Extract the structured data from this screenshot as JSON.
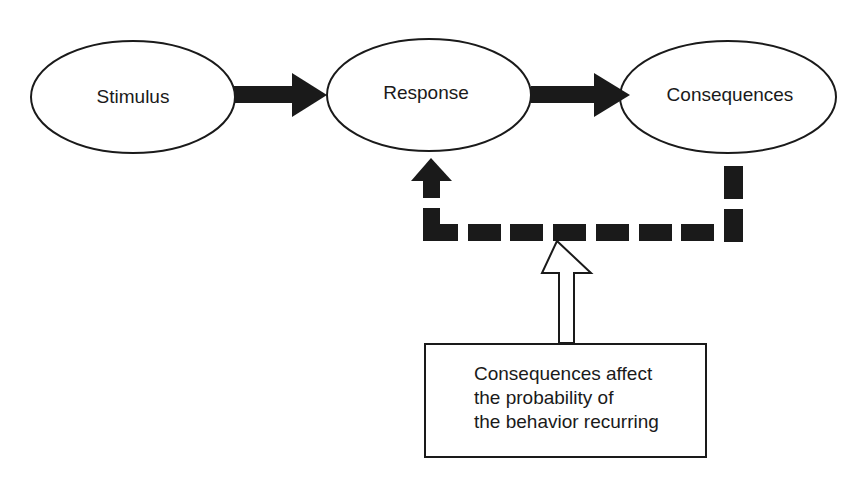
{
  "diagram": {
    "type": "flow",
    "nodes": [
      {
        "id": "stimulus",
        "label": "Stimulus",
        "shape": "ellipse"
      },
      {
        "id": "response",
        "label": "Response",
        "shape": "ellipse"
      },
      {
        "id": "consequences",
        "label": "Consequences",
        "shape": "ellipse"
      }
    ],
    "edges": [
      {
        "from": "stimulus",
        "to": "response",
        "style": "solid-thick-arrow"
      },
      {
        "from": "response",
        "to": "consequences",
        "style": "solid-thick-arrow"
      },
      {
        "from": "consequences",
        "to": "response",
        "style": "dashed-thick-feedback-arrow"
      }
    ],
    "note": {
      "lines": [
        "Consequences affect",
        "the probability of",
        "the behavior recurring"
      ],
      "points_to": "feedback-loop",
      "arrow_style": "hollow-arrow"
    },
    "colors": {
      "ink": "#1a1a1a",
      "background": "#ffffff"
    }
  }
}
